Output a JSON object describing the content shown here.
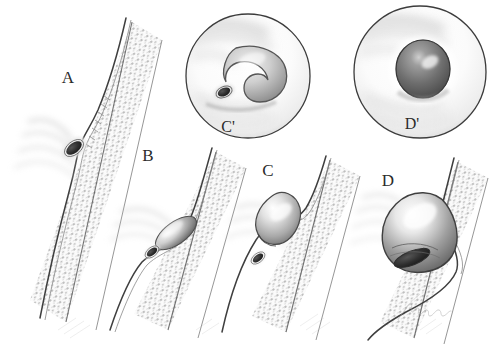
{
  "figure": {
    "background_color": "#ffffff",
    "ink_color": "#2b2b2b",
    "style": "grayscale medical pen-and-ink illustration",
    "signature": "Artist signature"
  },
  "panels": [
    {
      "id": "A",
      "label": "A",
      "label_x": 68,
      "label_y": 83,
      "description": "Flat depressed lesion within the mucosa; small dark slit-like focus",
      "lesion_type": "flat / depressed",
      "lesion_cx": 74,
      "lesion_cy": 148,
      "lesion_rx": 9,
      "lesion_ry": 5,
      "lesion_rotation": -38,
      "lesion_fill": "#3a3a3a",
      "wall_angle": -38,
      "wall_x": 120,
      "wall_y": 20
    },
    {
      "id": "B",
      "label": "B",
      "label_x": 148,
      "label_y": 161,
      "description": "Slightly elevated lesion beginning to bulge into the lumen",
      "lesion_type": "slightly elevated",
      "lesion_cx": 170,
      "lesion_cy": 243,
      "lesion_rx": 18,
      "lesion_ry": 9,
      "lesion_rotation": -36,
      "lesion_fill": "#6f6f6f",
      "wall_angle": -36,
      "wall_x": 208,
      "wall_y": 150
    },
    {
      "id": "C",
      "label": "C",
      "label_x": 268,
      "label_y": 176,
      "description": "Sessile rounded polyp protruding into the lumen with residual depressed focus below",
      "lesion_type": "sessile / protruded",
      "lesion_cx": 288,
      "lesion_cy": 225,
      "lesion_rx": 19,
      "lesion_ry": 15,
      "lesion_rotation": -32,
      "lesion_fill": "#8d8d8d",
      "wall_angle": -34,
      "wall_x": 322,
      "wall_y": 158
    },
    {
      "id": "D",
      "label": "D",
      "label_x": 388,
      "label_y": 186,
      "description": "Large polypoid mass filling the lumen with constricted base",
      "lesion_type": "large polypoid mass",
      "lesion_cx": 420,
      "lesion_cy": 232,
      "lesion_rx": 34,
      "lesion_ry": 26,
      "lesion_rotation": -30,
      "lesion_fill": "#7d7d7d",
      "wall_angle": -32,
      "wall_x": 450,
      "wall_y": 160
    }
  ],
  "insets": [
    {
      "id": "C-prime",
      "label": "C'",
      "label_x": 228,
      "label_y": 132,
      "cx": 248,
      "cy": 76,
      "r": 63,
      "corresponds_to": "C",
      "view": "endoscopic en-face view",
      "description": "Crescent-shaped raised lesion with a small dark depressed opening below it",
      "lesion_fill": "#b5b5b5",
      "focus_fill": "#343434"
    },
    {
      "id": "D-prime",
      "label": "D'",
      "label_x": 412,
      "label_y": 129,
      "cx": 420,
      "cy": 72,
      "r": 67,
      "corresponds_to": "D",
      "view": "endoscopic en-face view",
      "description": "Round dome-shaped nodule with central specular highlight",
      "lesion_fill": "#6c6c6c",
      "focus_fill": "#4a4a4a"
    }
  ],
  "tissue": {
    "mucosa_label": "mucosal surface layer",
    "submucosa_label": "stippled submucosal band",
    "stipple_color": "#8e8e8e",
    "outline_color": "#4a4a4a",
    "shade_light": "#f2f2f2",
    "shade_mid": "#cccccc",
    "shade_dark": "#8a8a8a"
  }
}
